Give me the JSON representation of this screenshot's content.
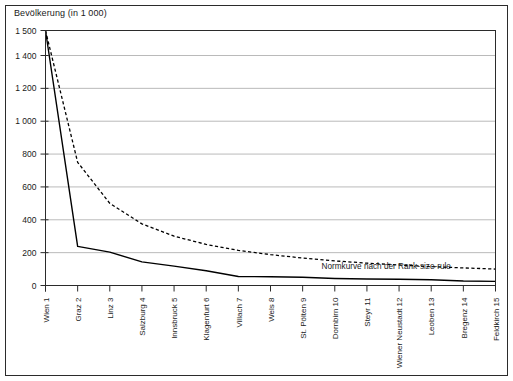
{
  "figure": {
    "title": "Bevölkerung (in 1 000)",
    "frame_color": "#2b2b2b",
    "grid_color": "#a8a8a8",
    "line_color": "#000000"
  },
  "chart_data": {
    "type": "line",
    "title": "Bevölkerung (in 1 000)",
    "xlabel": "",
    "ylabel": "Bevölkerung (in 1 000)",
    "grid": true,
    "legend": "none",
    "ylim": [
      0,
      1500
    ],
    "ytick_labels": [
      "0",
      "200",
      "400",
      "600",
      "800",
      "1 000",
      "1 200",
      "1 400",
      "1 500"
    ],
    "ytick_values": [
      0,
      200,
      400,
      600,
      800,
      1000,
      1200,
      1400,
      1500
    ],
    "categories": [
      "Wien  1",
      "Graz  2",
      "Linz  3",
      "Salzburg  4",
      "Innsbruck  5",
      "Klagenfurt  6",
      "Villach  7",
      "Wels  8",
      "St. Pölten  9",
      "Dornbirn  10",
      "Steyr  11",
      "Wiener Neustadt  12",
      "Leoben  13",
      "Bregenz  14",
      "Feldkirch  15"
    ],
    "city_names": [
      "Wien",
      "Graz",
      "Linz",
      "Salzburg",
      "Innsbruck",
      "Klagenfurt",
      "Villach",
      "Wels",
      "St. Pölten",
      "Dornbirn",
      "Steyr",
      "Wiener Neustadt",
      "Leoben",
      "Bregenz",
      "Feldkirch"
    ],
    "ranks": [
      1,
      2,
      3,
      4,
      5,
      6,
      7,
      8,
      9,
      10,
      11,
      12,
      13,
      14,
      15
    ],
    "series": [
      {
        "name": "Tatsächliche Bevölkerung",
        "style": "solid",
        "values": [
          1500,
          238,
          203,
          144,
          118,
          90,
          55,
          53,
          50,
          43,
          40,
          38,
          35,
          27,
          25
        ]
      },
      {
        "name": "Normkurve nach der Rank-size-rule",
        "style": "dashed",
        "values": [
          1500,
          750,
          500,
          375,
          300,
          250,
          214,
          188,
          167,
          150,
          136,
          125,
          115,
          107,
          100
        ]
      }
    ],
    "annotations": [
      {
        "text": "Normkurve nach der Rank-size-rule",
        "x_rank": 11.6,
        "y_value": 120
      }
    ]
  }
}
